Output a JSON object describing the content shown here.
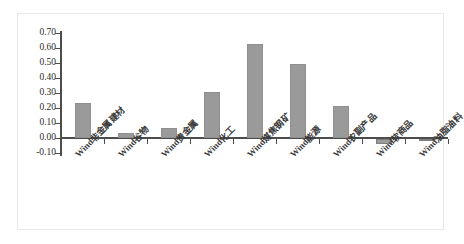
{
  "chart_data": {
    "type": "bar",
    "title": "",
    "subtitle": "",
    "xlabel": "",
    "ylabel": "",
    "categories": [
      "Wind非金属建材",
      "Wind谷物",
      "Wind贵金属",
      "Wind化工",
      "Wind煤焦钢矿",
      "Wind能源",
      "Wind农副产品",
      "Wind软商品",
      "Wind油脂油料"
    ],
    "values": [
      0.235,
      0.035,
      0.07,
      0.305,
      0.63,
      0.495,
      0.215,
      -0.03,
      -0.005
    ],
    "ylim": [
      -0.1,
      0.7
    ],
    "ytick_labels": [
      "0.70",
      "0.60",
      "0.50",
      "0.40",
      "0.30",
      "0.20",
      "0.10",
      "0.00",
      "-0.10"
    ],
    "ytick_values": [
      0.7,
      0.6,
      0.5,
      0.4,
      0.3,
      0.2,
      0.1,
      0.0,
      -0.1
    ],
    "grid": false,
    "legend": false,
    "legend_position": "none",
    "series_color": "#9a9a9a",
    "axis_color": "#4d4d4d",
    "background_color": "#ffffff",
    "frame_color": "#e8e8e8"
  }
}
